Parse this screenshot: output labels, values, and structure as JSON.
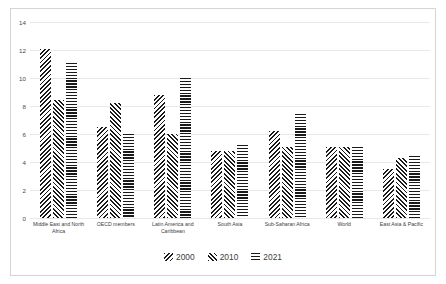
{
  "chart_data": {
    "type": "bar",
    "title": "",
    "subtitle": "",
    "xlabel": "",
    "ylabel": "",
    "ylim": [
      0,
      14
    ],
    "yticks": [
      0,
      2,
      4,
      6,
      8,
      10,
      12,
      14
    ],
    "grid": true,
    "legend_position": "bottom",
    "categories": [
      "Middle East and North Africa",
      "OECD members",
      "Latin America and Caribbean",
      "South Asia",
      "Sub-Saharan Africa",
      "World",
      "East Asia & Pacific"
    ],
    "series": [
      {
        "name": "2000",
        "pattern": "backward-diagonal-hatch",
        "values": [
          12.1,
          6.5,
          8.8,
          4.8,
          6.2,
          5.1,
          3.5
        ]
      },
      {
        "name": "2010",
        "pattern": "forward-diagonal-hatch",
        "values": [
          8.4,
          8.2,
          6.0,
          4.8,
          5.1,
          5.1,
          4.3
        ]
      },
      {
        "name": "2021",
        "pattern": "horizontal-lines",
        "values": [
          11.1,
          6.0,
          10.0,
          5.2,
          7.4,
          5.1,
          4.4
        ]
      }
    ]
  }
}
